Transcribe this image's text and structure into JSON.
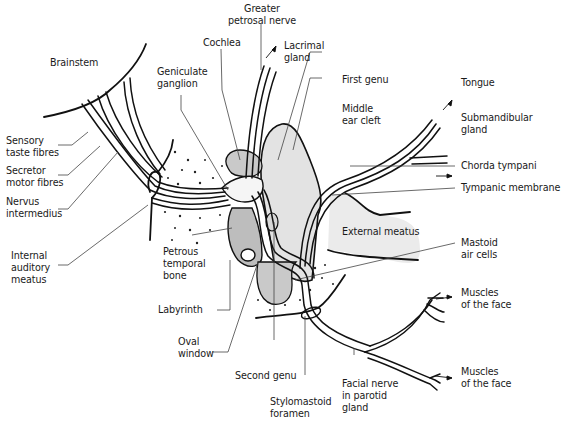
{
  "figure": {
    "colors": {
      "line": "#111111",
      "shade_light": "#e3e3e3",
      "shade_mid": "#c9c9c9",
      "shade_dark": "#b8b8b8",
      "background": "#ffffff"
    }
  },
  "labels": {
    "brainstem": "Brainstem",
    "sensory_taste_fibres": "Sensory\ntaste fibres",
    "secretor_motor_fibres": "Secretor\nmotor fibres",
    "nervus_intermedius": "Nervus\nintermedius",
    "internal_auditory_meatus": "Internal\nauditory\nmeatus",
    "geniculate_ganglion": "Geniculate\nganglion",
    "cochlea": "Cochlea",
    "greater_petrosal_nerve": "Greater\npetrosal nerve",
    "lacrimal_gland": "Lacrimal\ngland",
    "first_genu": "First genu",
    "middle_ear_cleft": "Middle\near cleft",
    "tongue": "Tongue",
    "submandibular_gland": "Submandibular\ngland",
    "chorda_tympani": "Chorda tympani",
    "tympanic_membrane": "Tympanic membrane",
    "external_meatus": "External meatus",
    "mastoid_air_cells": "Mastoid\nair cells",
    "petrous_temporal_bone": "Petrous\ntemporal\nbone",
    "labyrinth": "Labyrinth",
    "oval_window": "Oval\nwindow",
    "second_genu": "Second genu",
    "stylomastoid_foramen": "Stylomastoid\nforamen",
    "facial_nerve_in_parotid_gland": "Facial nerve\nin parotid\ngland",
    "muscles_of_the_face_upper": "Muscles\nof the face",
    "muscles_of_the_face_lower": "Muscles\nof the face"
  }
}
